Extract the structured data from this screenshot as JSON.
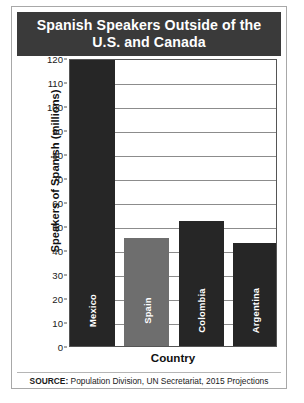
{
  "title": "Spanish Speakers Outside of the U.S. and Canada",
  "source": {
    "label": "SOURCE:",
    "text": " Population Division, UN Secretariat, 2015 Projections"
  },
  "colors": {
    "title_banner": "#3a3a3a",
    "bar_dark": "#262626",
    "bar_medium": "#6e6e6e",
    "gridline": "#8c8c8c",
    "axis": "#555555",
    "frame": "#a8a8a8",
    "background": "#ffffff",
    "bar_label_text": "#ffffff"
  },
  "chart_data": {
    "type": "bar",
    "title": "Spanish Speakers Outside of the U.S. and Canada",
    "xlabel": "Country",
    "ylabel": "Speakers of Spanish (millions)",
    "categories": [
      "Mexico",
      "Spain",
      "Colombia",
      "Argentina"
    ],
    "values": [
      119,
      45,
      52,
      43
    ],
    "series": [
      {
        "name": "Speakers of Spanish (millions)",
        "values": [
          119,
          45,
          52,
          43
        ]
      }
    ],
    "bar_colors": [
      "#262626",
      "#6e6e6e",
      "#262626",
      "#262626"
    ],
    "ylim": [
      0,
      120
    ],
    "ytick_values": [
      0,
      10,
      20,
      30,
      40,
      50,
      60,
      70,
      80,
      90,
      100,
      110,
      120
    ],
    "ytick_labels": [
      "0",
      "10",
      "20",
      "30",
      "40",
      "50",
      "60",
      "70",
      "80",
      "90",
      "100",
      "110",
      "120"
    ],
    "grid": "horizontal",
    "legend": "none",
    "annotations": [
      "SOURCE: Population Division, UN Secretariat, 2015 Projections"
    ]
  }
}
